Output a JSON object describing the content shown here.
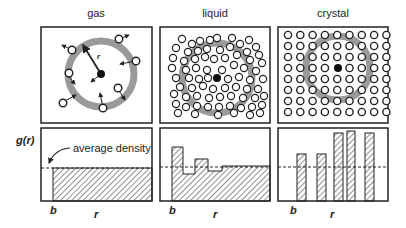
{
  "panels": [
    {
      "id": "gas",
      "title": "gas",
      "b_label": "b",
      "r_label": "r"
    },
    {
      "id": "liquid",
      "title": "liquid",
      "b_label": "b",
      "r_label": "r"
    },
    {
      "id": "crystal",
      "title": "crystal",
      "b_label": "b",
      "r_label": "r"
    }
  ],
  "y_axis_label": "g(r)",
  "annotation": "average density",
  "colors": {
    "ring": "#9a9a9a",
    "stroke": "#222222",
    "hatch": "#333333",
    "background": "#ffffff"
  },
  "icons": {
    "reference_particle": "filled-circle",
    "particle": "open-circle",
    "velocity": "arrow"
  },
  "chart_data": [
    {
      "type": "area",
      "title": "gas",
      "ylabel": "g(r)",
      "xlabel": "r",
      "x_markers": [
        "b"
      ],
      "description": "g(r)=0 for r<b, then flat at average density (1.0)",
      "x": [
        0,
        1,
        1,
        10
      ],
      "y": [
        0,
        0,
        1.0,
        1.0
      ],
      "reference_line": {
        "label": "average density",
        "value": 1.0,
        "style": "dashed"
      }
    },
    {
      "type": "area",
      "title": "liquid",
      "ylabel": "g(r)",
      "xlabel": "r",
      "x_markers": [
        "b"
      ],
      "description": "g(r)=0 for r<b, oscillating step profile damping to average density",
      "x": [
        0,
        1,
        1,
        2,
        2,
        3,
        3,
        4,
        4,
        5.2,
        5.2,
        10
      ],
      "y": [
        0,
        0,
        1.5,
        1.5,
        0.85,
        0.85,
        1.2,
        1.2,
        0.93,
        0.93,
        1.02,
        1.02
      ],
      "reference_line": {
        "label": "average density",
        "value": 1.0,
        "style": "dashed"
      }
    },
    {
      "type": "bar",
      "title": "crystal",
      "ylabel": "g(r)",
      "xlabel": "r",
      "x_markers": [
        "b"
      ],
      "description": "discrete peaks at lattice distances",
      "categories": [
        "peak1",
        "peak2",
        "peak3",
        "peak4",
        "peak5"
      ],
      "values": [
        1.4,
        1.4,
        2.0,
        2.05,
        2.0
      ],
      "reference_line": {
        "label": "average density",
        "value": 1.0,
        "style": "dashed"
      }
    }
  ]
}
